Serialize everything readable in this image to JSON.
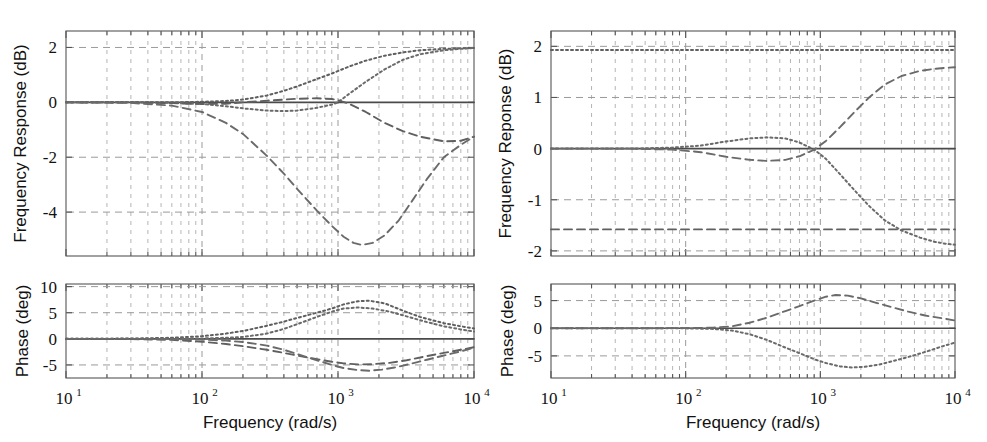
{
  "figure": {
    "width": 987,
    "height": 442,
    "background": "#ffffff",
    "panel_count": 2
  },
  "common": {
    "xlabel": "Frequency (rad/s)",
    "x_tick_labels": [
      "10",
      "10",
      "10",
      "10"
    ],
    "x_tick_exponents": [
      "1",
      "2",
      "3",
      "4"
    ],
    "x_decades": [
      1,
      2,
      3,
      4
    ],
    "xlim": [
      10,
      10000
    ],
    "xscale": "log",
    "grid": true,
    "line_colors": {
      "dotted": "#5f5f5f",
      "dashed": "#5f5f5f",
      "solid": "#4a4a4a"
    }
  },
  "chart_data": [
    {
      "id": "left-magnitude",
      "panel": "left",
      "position": "top",
      "type": "line",
      "title": "",
      "xlabel": "",
      "ylabel": "Frequency Response (dB)",
      "xscale": "log",
      "xlim": [
        10,
        10000
      ],
      "ylim": [
        -5.6,
        2.6
      ],
      "yticks": [
        2,
        0,
        -2,
        -4
      ],
      "ytick_labels": [
        "2",
        "0",
        "-2",
        "-4"
      ],
      "grid": true,
      "legend": "none",
      "series": [
        {
          "name": "reference-zero",
          "style": "solid",
          "color": "#4a4a4a",
          "x": [
            10,
            10000
          ],
          "y": [
            0,
            0
          ]
        },
        {
          "name": "dotted-rise-early",
          "style": "dotted",
          "color": "#5f5f5f",
          "x": [
            10,
            30,
            60,
            100,
            150,
            200,
            300,
            400,
            500,
            700,
            900,
            1200,
            1600,
            2200,
            3000,
            4000,
            6000,
            8000,
            10000
          ],
          "y": [
            0.0,
            0.0,
            0.0,
            0.02,
            0.05,
            0.1,
            0.25,
            0.42,
            0.58,
            0.85,
            1.05,
            1.3,
            1.52,
            1.7,
            1.82,
            1.9,
            1.95,
            1.97,
            1.98
          ]
        },
        {
          "name": "dotted-dip-then-rise",
          "style": "dotted",
          "color": "#6a6a6a",
          "x": [
            10,
            30,
            60,
            100,
            150,
            200,
            300,
            400,
            500,
            700,
            900,
            1000,
            1200,
            1600,
            2200,
            3000,
            4000,
            6000,
            8000,
            10000
          ],
          "y": [
            0.0,
            0.0,
            -0.02,
            -0.06,
            -0.14,
            -0.22,
            -0.3,
            -0.32,
            -0.3,
            -0.2,
            -0.08,
            0.0,
            0.3,
            0.75,
            1.2,
            1.55,
            1.75,
            1.9,
            1.95,
            1.98
          ]
        },
        {
          "name": "dashed-shallow",
          "style": "dashed",
          "color": "#5f5f5f",
          "x": [
            10,
            30,
            60,
            100,
            150,
            200,
            300,
            400,
            500,
            700,
            900,
            1000,
            1200,
            1600,
            2200,
            3000,
            4000,
            6000,
            8000,
            10000
          ],
          "y": [
            0.0,
            0.0,
            -0.03,
            -0.06,
            -0.05,
            0.0,
            0.06,
            0.1,
            0.13,
            0.15,
            0.12,
            0.08,
            -0.05,
            -0.35,
            -0.75,
            -1.05,
            -1.25,
            -1.42,
            -1.4,
            -1.25
          ]
        },
        {
          "name": "dashed-deep-notch",
          "style": "dashed",
          "color": "#6a6a6a",
          "x": [
            10,
            30,
            60,
            100,
            150,
            200,
            300,
            400,
            500,
            700,
            900,
            1100,
            1300,
            1500,
            1800,
            2200,
            2800,
            3500,
            4500,
            6000,
            8000,
            10000
          ],
          "y": [
            0.0,
            -0.02,
            -0.12,
            -0.35,
            -0.75,
            -1.15,
            -1.95,
            -2.6,
            -3.15,
            -3.95,
            -4.5,
            -4.9,
            -5.12,
            -5.2,
            -5.12,
            -4.85,
            -4.3,
            -3.6,
            -2.8,
            -2.0,
            -1.55,
            -1.25
          ]
        }
      ]
    },
    {
      "id": "left-phase",
      "panel": "left",
      "position": "bottom",
      "type": "line",
      "title": "",
      "xlabel": "Frequency (rad/s)",
      "ylabel": "Phase (deg)",
      "xscale": "log",
      "xlim": [
        10,
        10000
      ],
      "ylim": [
        -7.5,
        10.5
      ],
      "yticks": [
        10,
        5,
        0,
        -5
      ],
      "ytick_labels": [
        "10",
        "5",
        "0",
        "-5"
      ],
      "grid": true,
      "legend": "none",
      "series": [
        {
          "name": "reference-zero",
          "style": "solid",
          "color": "#4a4a4a",
          "x": [
            10,
            10000
          ],
          "y": [
            0,
            0
          ]
        },
        {
          "name": "dotted-peak-high",
          "style": "dotted",
          "color": "#5f5f5f",
          "x": [
            10,
            30,
            60,
            100,
            150,
            200,
            300,
            400,
            500,
            700,
            900,
            1100,
            1400,
            1700,
            2200,
            3000,
            4000,
            6000,
            8000,
            10000
          ],
          "y": [
            0.0,
            0.05,
            0.2,
            0.5,
            1.0,
            1.5,
            2.5,
            3.3,
            4.0,
            5.0,
            5.8,
            6.6,
            7.2,
            7.3,
            6.8,
            5.4,
            4.2,
            3.0,
            2.4,
            2.0
          ]
        },
        {
          "name": "dotted-peak-late",
          "style": "dotted",
          "color": "#6a6a6a",
          "x": [
            10,
            30,
            60,
            100,
            150,
            200,
            300,
            400,
            500,
            700,
            900,
            1100,
            1400,
            1800,
            2400,
            3200,
            4500,
            6000,
            8000,
            10000
          ],
          "y": [
            0.0,
            0.0,
            0.02,
            0.08,
            0.2,
            0.35,
            1.0,
            1.9,
            2.8,
            4.2,
            5.2,
            5.8,
            6.0,
            5.8,
            5.2,
            4.3,
            3.2,
            2.4,
            1.8,
            1.4
          ]
        },
        {
          "name": "dashed-shallow-dip",
          "style": "dashed",
          "color": "#5f5f5f",
          "x": [
            10,
            30,
            60,
            100,
            150,
            200,
            300,
            400,
            500,
            700,
            900,
            1100,
            1400,
            1800,
            2400,
            3200,
            4500,
            6000,
            8000,
            10000
          ],
          "y": [
            0.0,
            -0.05,
            -0.2,
            -0.55,
            -1.0,
            -1.4,
            -2.1,
            -2.7,
            -3.2,
            -3.9,
            -4.4,
            -4.7,
            -4.9,
            -4.85,
            -4.6,
            -4.1,
            -3.3,
            -2.7,
            -2.1,
            -1.6
          ]
        },
        {
          "name": "dashed-deep-dip",
          "style": "dashed",
          "color": "#6a6a6a",
          "x": [
            10,
            30,
            60,
            100,
            150,
            200,
            300,
            400,
            500,
            700,
            900,
            1100,
            1400,
            1700,
            2100,
            2600,
            3400,
            4500,
            6000,
            8000,
            10000
          ],
          "y": [
            0.0,
            0.0,
            -0.05,
            -0.15,
            -0.35,
            -0.6,
            -1.3,
            -2.1,
            -2.9,
            -4.1,
            -5.0,
            -5.6,
            -6.0,
            -6.1,
            -5.9,
            -5.5,
            -4.8,
            -4.0,
            -3.2,
            -2.4,
            -1.7
          ]
        }
      ]
    },
    {
      "id": "right-magnitude",
      "panel": "right",
      "position": "top",
      "type": "line",
      "title": "",
      "xlabel": "",
      "ylabel": "Frequency Reponse (dB)",
      "xscale": "log",
      "xlim": [
        10,
        10000
      ],
      "ylim": [
        -2.1,
        2.3
      ],
      "yticks": [
        2,
        1,
        0,
        -1,
        -2
      ],
      "ytick_labels": [
        "2",
        "1",
        "0",
        "-1",
        "-2"
      ],
      "grid": true,
      "legend": "none",
      "series": [
        {
          "name": "reference-zero",
          "style": "solid",
          "color": "#4a4a4a",
          "x": [
            10,
            10000
          ],
          "y": [
            0,
            0
          ]
        },
        {
          "name": "dotted-upper-bound",
          "style": "dotted",
          "color": "#5f5f5f",
          "x": [
            10,
            10000
          ],
          "y": [
            1.93,
            1.93
          ]
        },
        {
          "name": "dashed-lower-bound",
          "style": "dashed",
          "color": "#5f5f5f",
          "x": [
            10,
            10000
          ],
          "y": [
            -1.58,
            -1.58
          ]
        },
        {
          "name": "dashed-rising",
          "style": "dashed",
          "color": "#6a6a6a",
          "x": [
            10,
            40,
            80,
            130,
            200,
            300,
            400,
            550,
            700,
            900,
            1100,
            1400,
            1800,
            2300,
            3000,
            4000,
            5500,
            7000,
            8500,
            10000
          ],
          "y": [
            0.0,
            0.0,
            -0.02,
            -0.07,
            -0.16,
            -0.22,
            -0.24,
            -0.22,
            -0.15,
            -0.02,
            0.15,
            0.42,
            0.72,
            1.0,
            1.25,
            1.42,
            1.52,
            1.56,
            1.58,
            1.59
          ]
        },
        {
          "name": "dotted-falling",
          "style": "dotted",
          "color": "#6a6a6a",
          "x": [
            10,
            40,
            80,
            130,
            200,
            300,
            400,
            550,
            700,
            900,
            1100,
            1400,
            1800,
            2300,
            3000,
            4000,
            5500,
            7000,
            8500,
            10000
          ],
          "y": [
            0.0,
            0.0,
            0.02,
            0.06,
            0.14,
            0.2,
            0.22,
            0.2,
            0.12,
            -0.02,
            -0.2,
            -0.5,
            -0.82,
            -1.12,
            -1.4,
            -1.6,
            -1.74,
            -1.82,
            -1.86,
            -1.88
          ]
        }
      ]
    },
    {
      "id": "right-phase",
      "panel": "right",
      "position": "bottom",
      "type": "line",
      "title": "",
      "xlabel": "Frequency (rad/s)",
      "ylabel": "Phase (deg)",
      "xscale": "log",
      "xlim": [
        10,
        10000
      ],
      "ylim": [
        -9,
        8
      ],
      "yticks": [
        5,
        0,
        -5
      ],
      "ytick_labels": [
        "5",
        "0",
        "-5"
      ],
      "grid": true,
      "legend": "none",
      "series": [
        {
          "name": "reference-zero",
          "style": "solid",
          "color": "#4a4a4a",
          "x": [
            10,
            10000
          ],
          "y": [
            0,
            0
          ]
        },
        {
          "name": "dashed-positive-hump",
          "style": "dashed",
          "color": "#6a6a6a",
          "x": [
            10,
            50,
            100,
            160,
            220,
            300,
            400,
            550,
            700,
            900,
            1100,
            1300,
            1600,
            2000,
            2600,
            3400,
            4500,
            6000,
            8000,
            10000
          ],
          "y": [
            0.0,
            0.0,
            0.02,
            0.1,
            0.35,
            1.0,
            1.9,
            3.1,
            4.0,
            5.0,
            5.7,
            6.0,
            5.9,
            5.4,
            4.6,
            3.8,
            3.0,
            2.3,
            1.8,
            1.4
          ]
        },
        {
          "name": "dotted-negative-hump",
          "style": "dotted",
          "color": "#6a6a6a",
          "x": [
            10,
            50,
            100,
            160,
            220,
            300,
            400,
            550,
            700,
            900,
            1100,
            1400,
            1700,
            2100,
            2700,
            3500,
            4500,
            6000,
            8000,
            10000
          ],
          "y": [
            0.0,
            0.0,
            -0.02,
            -0.12,
            -0.4,
            -1.1,
            -2.1,
            -3.5,
            -4.5,
            -5.6,
            -6.3,
            -6.9,
            -7.1,
            -7.0,
            -6.6,
            -5.9,
            -5.2,
            -4.3,
            -3.3,
            -2.6
          ]
        }
      ]
    }
  ]
}
